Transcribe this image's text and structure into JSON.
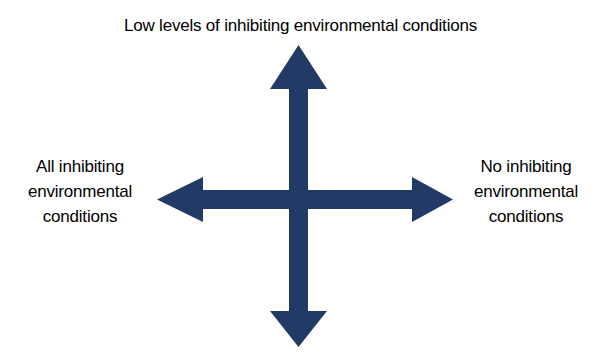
{
  "diagram": {
    "type": "two-axis-cross-arrows",
    "background_color": "#ffffff",
    "arrow_color": "#213a66",
    "text_color": "#000000",
    "center": {
      "x": 298,
      "y": 199
    },
    "labels": {
      "top": "Low levels of inhibiting environmental conditions",
      "left": "All inhibiting\nenvironmental\nconditions",
      "right": "No inhibiting\nenvironmental\nconditions",
      "bottom": ""
    },
    "axes": [
      {
        "name": "vertical-axis",
        "orientation": "vertical",
        "arrowheads": [
          "up",
          "down"
        ],
        "top_label": "Low levels of inhibiting environmental conditions",
        "bottom_label": ""
      },
      {
        "name": "horizontal-axis",
        "orientation": "horizontal",
        "arrowheads": [
          "left",
          "right"
        ],
        "left_label": "All inhibiting environmental conditions",
        "right_label": "No inhibiting environmental conditions"
      }
    ],
    "arrows": [
      {
        "name": "up-arrow",
        "direction": "up",
        "tip": {
          "x": 300,
          "y": 46
        },
        "head_base": {
          "y": 88
        },
        "head_width": 52,
        "shaft_width": 18
      },
      {
        "name": "down-arrow",
        "direction": "down",
        "tip": {
          "x": 300,
          "y": 346
        },
        "head_base": {
          "y": 312
        },
        "head_width": 52,
        "shaft_width": 18
      },
      {
        "name": "left-arrow",
        "direction": "left",
        "tip": {
          "x": 158,
          "y": 199
        },
        "head_base": {
          "x": 202
        },
        "head_height": 44,
        "shaft_width": 18
      },
      {
        "name": "right-arrow",
        "direction": "right",
        "tip": {
          "x": 452,
          "y": 199
        },
        "head_base": {
          "x": 413
        },
        "head_height": 44,
        "shaft_width": 18
      }
    ]
  }
}
